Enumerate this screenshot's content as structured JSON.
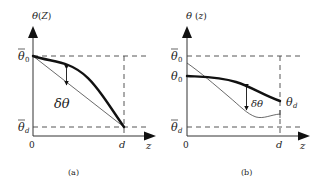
{
  "figure": {
    "panels": [
      {
        "id": "a",
        "caption": "(a)",
        "y_axis_label": "θ(z)",
        "x_axis_label": "z",
        "origin_label": "0",
        "x_end_label": "d",
        "upper_bound_label": "θ̄0",
        "lower_bound_label": "θ̄d",
        "delta_label": "δθ",
        "curves": [
          {
            "name": "thick-profile",
            "description": "Thick curve from θ̄0 at z=0 bulging above the straight line, ending at θ̄d at z=d"
          },
          {
            "name": "thin-linear",
            "description": "Thin straight line from θ̄0 at z=0 to θ̄d at z=d"
          }
        ]
      },
      {
        "id": "b",
        "caption": "(b)",
        "y_axis_label": "θ(z)",
        "x_axis_label": "z",
        "origin_label": "0",
        "x_end_label": "d",
        "upper_bound_label": "θ̄0",
        "lower_bound_label": "θ̄d",
        "start_label": "θ0",
        "end_label": "θd",
        "delta_label": "δθ",
        "curves": [
          {
            "name": "thick-profile",
            "description": "Thick curve from θ0 at z=0 decreasing to θd at z=d"
          },
          {
            "name": "thin-profile",
            "description": "Thin curve starting above θ0, crossing the thick curve, dipping near θ̄d and ending slightly above"
          }
        ]
      }
    ]
  }
}
